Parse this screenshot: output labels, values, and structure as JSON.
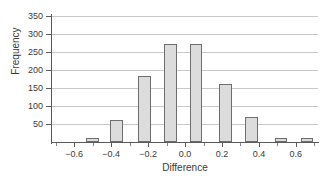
{
  "chart_data": {
    "type": "bar",
    "title": "",
    "subtitle": "",
    "xlabel": "Difference",
    "ylabel": "Frequency",
    "grid": true,
    "legend": false,
    "legend_position": "none",
    "xlim": [
      -0.72,
      0.72
    ],
    "ylim": [
      0,
      350
    ],
    "ytick_labels": [
      "350",
      "300",
      "250",
      "200",
      "150",
      "100",
      "50"
    ],
    "ytick_values": [
      350,
      300,
      250,
      200,
      150,
      100,
      50
    ],
    "xtick_labels": [
      "−0.6",
      "−0.4",
      "−0.2",
      "0.0",
      "0.2",
      "0.4",
      "0.6"
    ],
    "xtick_values": [
      -0.6,
      -0.4,
      -0.2,
      0.0,
      0.2,
      0.4,
      0.6
    ],
    "bin_width": 0.07,
    "categories": [
      -0.5,
      -0.37,
      -0.22,
      -0.08,
      0.06,
      0.22,
      0.36,
      0.52,
      0.66
    ],
    "values": [
      10,
      62,
      183,
      272,
      273,
      160,
      70,
      12,
      10
    ],
    "bar_fill": "#dcdcdc",
    "bar_stroke": "#6e6e6e",
    "grid_color": "#c9c9c9",
    "axis_color": "#5a5a5a",
    "background": "#ffffff"
  }
}
